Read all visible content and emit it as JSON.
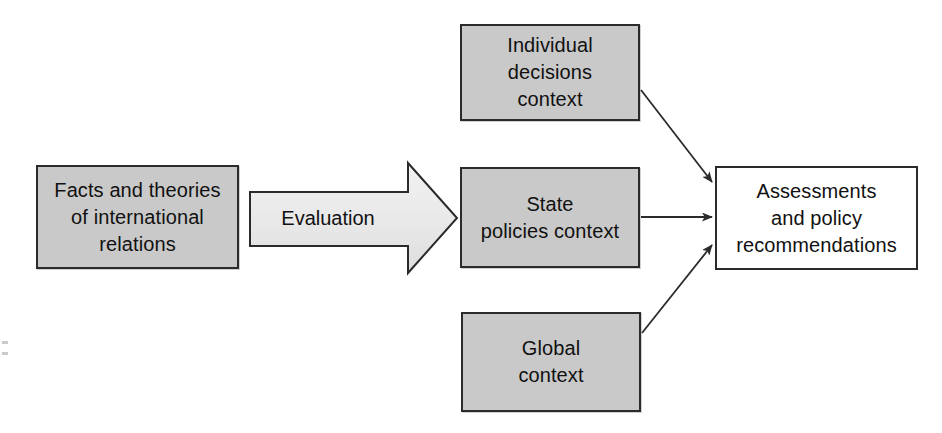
{
  "diagram": {
    "background_color": "#ffffff",
    "node_fill_color": "#c9c9c9",
    "node_plain_color": "#ffffff",
    "node_border_color": "#2b2b2b",
    "connector_color": "#2b2b2b",
    "nodes": {
      "facts": {
        "label": "Facts and theories\nof international\nrelations",
        "style": "filled"
      },
      "individual_context": {
        "label": "Individual decisions\ncontext",
        "style": "filled"
      },
      "state_context": {
        "label": "State\npolicies context",
        "style": "filled"
      },
      "global_context": {
        "label": "Global\ncontext",
        "style": "filled"
      },
      "assessments": {
        "label": "Assessments\nand policy\nrecommendations",
        "style": "plain"
      }
    },
    "arrows": {
      "evaluation": {
        "label": "Evaluation",
        "kind": "block-arrow",
        "from": "facts",
        "to": "state_context"
      },
      "individual_to_assessments": {
        "label": "",
        "kind": "line-arrow",
        "from": "individual_context",
        "to": "assessments"
      },
      "state_to_assessments": {
        "label": "",
        "kind": "line-arrow",
        "from": "state_context",
        "to": "assessments"
      },
      "global_to_assessments": {
        "label": "",
        "kind": "line-arrow",
        "from": "global_context",
        "to": "assessments"
      }
    }
  }
}
